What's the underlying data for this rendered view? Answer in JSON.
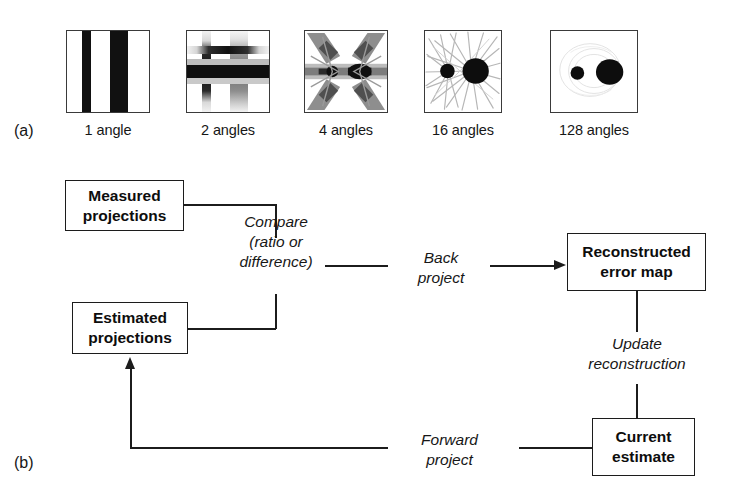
{
  "figure": {
    "part_a_tag": "(a)",
    "part_b_tag": "(b)"
  },
  "part_a": {
    "panels": [
      {
        "label": "1 angle",
        "icon": "reconstruction-1-angle"
      },
      {
        "label": "2 angles",
        "icon": "reconstruction-2-angles"
      },
      {
        "label": "4 angles",
        "icon": "reconstruction-4-angles"
      },
      {
        "label": "16 angles",
        "icon": "reconstruction-16-angles"
      },
      {
        "label": "128 angles",
        "icon": "reconstruction-128-angles"
      }
    ]
  },
  "part_b": {
    "nodes": [
      {
        "id": "measured",
        "line1": "Measured",
        "line2": "projections"
      },
      {
        "id": "estimated",
        "line1": "Estimated",
        "line2": "projections"
      },
      {
        "id": "reconstructed",
        "line1": "Reconstructed",
        "line2": "error map"
      },
      {
        "id": "current",
        "line1": "Current",
        "line2": "estimate"
      }
    ],
    "edges": [
      {
        "id": "compare",
        "line1": "Compare",
        "line2": "(ratio or",
        "line3": "difference)"
      },
      {
        "id": "back",
        "line1": "Back",
        "line2": "project"
      },
      {
        "id": "update",
        "line1": "Update",
        "line2": "reconstruction"
      },
      {
        "id": "forward",
        "line1": "Forward",
        "line2": "project"
      }
    ]
  },
  "colors": {
    "ink": "#1c1c1c",
    "panel_border": "#3a3a3a",
    "background": "#ffffff"
  }
}
